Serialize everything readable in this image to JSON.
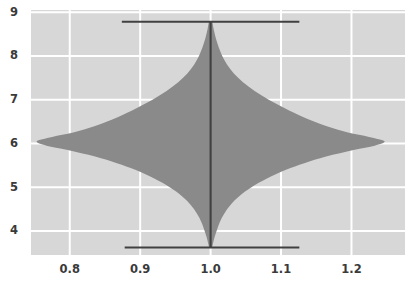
{
  "chart_data": {
    "type": "violin",
    "title": "",
    "subtitle": "",
    "xlabel": "",
    "ylabel": "",
    "xlim": [
      0.745,
      1.276
    ],
    "ylim": [
      3.45,
      9.05
    ],
    "grid": true,
    "grid_color": "#ffffff",
    "plot_bg": "#d7d7d7",
    "figure_bg": "#ffffff",
    "violin_fill": "#8a8a8a",
    "line_color": "#404040",
    "legend": "none",
    "xticks": [
      0.8,
      0.9,
      1.0,
      1.1,
      1.2
    ],
    "xtick_labels": [
      "0.8",
      "0.9",
      "1.0",
      "1.1",
      "1.2"
    ],
    "yticks": [
      4,
      5,
      6,
      7,
      8,
      9
    ],
    "ytick_labels": [
      "4",
      "5",
      "6",
      "7",
      "8",
      "9"
    ],
    "series": [
      {
        "name": "group-1",
        "center_x": 1.0,
        "median_line": {
          "x": 1.0,
          "y_min": 3.62,
          "y_max": 8.78
        },
        "whisker_caps": [
          {
            "y": 8.78,
            "x_start": 0.874,
            "x_end": 1.126
          },
          {
            "y": 3.62,
            "x_start": 0.878,
            "x_end": 1.126
          }
        ],
        "density_max_halfwidth": 0.247,
        "density_peak_y": 6.05,
        "density_profile": [
          {
            "y": 8.78,
            "halfwidth": 0.0025
          },
          {
            "y": 8.6,
            "halfwidth": 0.0045
          },
          {
            "y": 8.4,
            "halfwidth": 0.0075
          },
          {
            "y": 8.2,
            "halfwidth": 0.0115
          },
          {
            "y": 8.0,
            "halfwidth": 0.0165
          },
          {
            "y": 7.8,
            "halfwidth": 0.0235
          },
          {
            "y": 7.6,
            "halfwidth": 0.033
          },
          {
            "y": 7.4,
            "halfwidth": 0.046
          },
          {
            "y": 7.2,
            "halfwidth": 0.0625
          },
          {
            "y": 7.0,
            "halfwidth": 0.0825
          },
          {
            "y": 6.8,
            "halfwidth": 0.106
          },
          {
            "y": 6.6,
            "halfwidth": 0.132
          },
          {
            "y": 6.4,
            "halfwidth": 0.164
          },
          {
            "y": 6.25,
            "halfwidth": 0.195
          },
          {
            "y": 6.15,
            "halfwidth": 0.225
          },
          {
            "y": 6.05,
            "halfwidth": 0.247
          },
          {
            "y": 5.95,
            "halfwidth": 0.233
          },
          {
            "y": 5.85,
            "halfwidth": 0.203
          },
          {
            "y": 5.7,
            "halfwidth": 0.164
          },
          {
            "y": 5.55,
            "halfwidth": 0.133
          },
          {
            "y": 5.4,
            "halfwidth": 0.107
          },
          {
            "y": 5.2,
            "halfwidth": 0.08
          },
          {
            "y": 5.0,
            "halfwidth": 0.058
          },
          {
            "y": 4.8,
            "halfwidth": 0.041
          },
          {
            "y": 4.6,
            "halfwidth": 0.0285
          },
          {
            "y": 4.4,
            "halfwidth": 0.0195
          },
          {
            "y": 4.2,
            "halfwidth": 0.013
          },
          {
            "y": 4.0,
            "halfwidth": 0.0085
          },
          {
            "y": 3.85,
            "halfwidth": 0.0055
          },
          {
            "y": 3.7,
            "halfwidth": 0.0032
          },
          {
            "y": 3.62,
            "halfwidth": 0.0022
          }
        ]
      }
    ]
  },
  "caption": {
    "text": ""
  }
}
